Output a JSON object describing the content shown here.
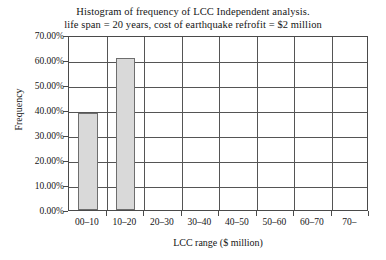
{
  "chart_data": {
    "type": "bar",
    "title": "Histogram of frequency of LCC Independent analysis.",
    "subtitle": "life span = 20 years, cost of earthquake refrofit = $2 million",
    "xlabel": "LCC range ($ million)",
    "ylabel": "Frequency",
    "categories": [
      "00–10",
      "10–20",
      "20–30",
      "30–40",
      "40–50",
      "50–60",
      "60–70",
      "70–"
    ],
    "values": [
      0.39,
      0.61,
      0,
      0,
      0,
      0,
      0,
      0
    ],
    "value_labels": [
      "39.00%",
      "61.00%",
      "0.00%",
      "0.00%",
      "0.00%",
      "0.00%",
      "0.00%",
      "0.00%"
    ],
    "ylim": [
      0,
      0.7
    ],
    "ytick_values": [
      0,
      0.1,
      0.2,
      0.3,
      0.4,
      0.5,
      0.6,
      0.7
    ],
    "ytick_labels": [
      "0.00%",
      "10.00%",
      "20.00%",
      "30.00%",
      "40.00%",
      "50.00%",
      "60.00%",
      "70.00%"
    ],
    "grid": true,
    "legend": false,
    "bar_color": "#d9d9d9",
    "bar_border_color": "#6e6e6e",
    "axis_color": "#4a4a4a"
  }
}
